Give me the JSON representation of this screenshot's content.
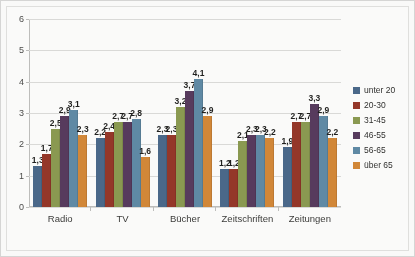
{
  "chart_data": {
    "type": "bar",
    "title": "",
    "xlabel": "",
    "ylabel": "",
    "ylim": [
      0,
      6
    ],
    "yticks": [
      0,
      1,
      2,
      3,
      4,
      5,
      6
    ],
    "grid": true,
    "legend_position": "right",
    "decimal_separator": ",",
    "categories": [
      "Radio",
      "TV",
      "Bücher",
      "Zeitschriften",
      "Zeitungen"
    ],
    "series": [
      {
        "name": "unter 20",
        "color": "#46688c",
        "values": [
          1.3,
          2.2,
          2.3,
          1.2,
          1.9
        ],
        "labels": [
          "1,3",
          "2,2",
          "2,3",
          "1,2",
          "1,9"
        ]
      },
      {
        "name": "20-30",
        "color": "#9a3324",
        "values": [
          1.7,
          2.4,
          2.3,
          1.2,
          2.7
        ],
        "labels": [
          "1,7",
          "2,4",
          "2,3",
          "1,2",
          "2,7"
        ]
      },
      {
        "name": "31-45",
        "color": "#8a9a4b",
        "values": [
          2.5,
          2.7,
          3.2,
          2.1,
          2.7
        ],
        "labels": [
          "2,5",
          "2,7",
          "3,2",
          "2,1",
          "2,7"
        ]
      },
      {
        "name": "46-55",
        "color": "#57385e",
        "values": [
          2.9,
          2.7,
          3.7,
          2.3,
          3.3
        ],
        "labels": [
          "2,9",
          "2,7",
          "3,7",
          "2,3",
          "3,3"
        ]
      },
      {
        "name": "56-65",
        "color": "#5b8aa8",
        "values": [
          3.1,
          2.8,
          4.1,
          2.3,
          2.9
        ],
        "labels": [
          "3,1",
          "2,8",
          "4,1",
          "2,3",
          "2,9"
        ]
      },
      {
        "name": "über 65",
        "color": "#d9862f",
        "values": [
          2.3,
          1.6,
          2.9,
          2.2,
          2.2
        ],
        "labels": [
          "2,3",
          "1,6",
          "2,9",
          "2,2",
          "2,2"
        ]
      }
    ]
  }
}
